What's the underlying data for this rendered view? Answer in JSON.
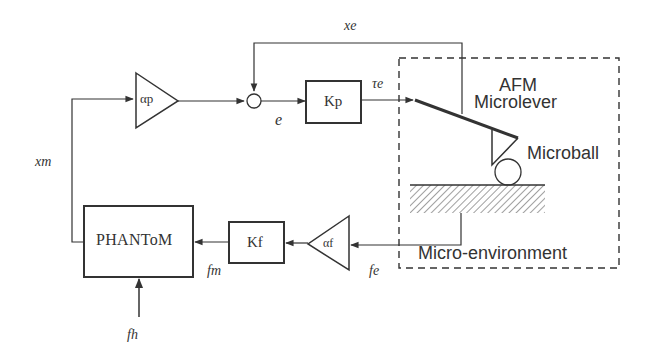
{
  "diagram": {
    "blocks": {
      "alpha_p": {
        "label": "αp",
        "type": "gain-triangle"
      },
      "summing_junction": {
        "type": "sum"
      },
      "kp": {
        "label": "Kp",
        "type": "block"
      },
      "afm": {
        "label_line1": "AFM",
        "label_line2": "Microlever"
      },
      "microball": {
        "label": "Microball"
      },
      "micro_environment": {
        "label": "Micro-environment"
      },
      "alpha_f": {
        "label": "αf",
        "type": "gain-triangle"
      },
      "kf": {
        "label": "Kf",
        "type": "block"
      },
      "phantom": {
        "label": "PHANToM",
        "type": "block"
      }
    },
    "signals": {
      "xe": "xe",
      "tau_e": "τe",
      "e": "e",
      "xm": "xm",
      "fm": "fm",
      "fe": "fe",
      "fh": "fh"
    },
    "colors": {
      "stroke": "#333333",
      "background": "#ffffff",
      "hatch": "#777777"
    }
  }
}
